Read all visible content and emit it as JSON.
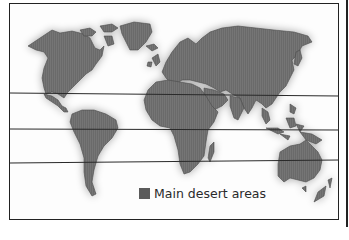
{
  "map": {
    "title": "",
    "land_color": "#6b6b6b",
    "land_outline_color": "#4a4a4a",
    "line_color": "#2a2a2a",
    "frame_color": "#222222",
    "latitude_lines": [
      {
        "name": "tropic-of-cancer",
        "y_left": 93,
        "y_right": 96
      },
      {
        "name": "equator",
        "y_left": 129,
        "y_right": 130
      },
      {
        "name": "tropic-of-capricorn",
        "y_left": 163,
        "y_right": 160
      }
    ],
    "regions": [
      "North America",
      "Greenland",
      "South America",
      "Europe",
      "Asia",
      "Africa",
      "Madagascar",
      "Arabian Peninsula",
      "Indonesia",
      "Australia",
      "New Zealand",
      "Japan",
      "Iceland",
      "British Isles"
    ]
  },
  "legend": {
    "swatch_color": "#5b5b5b",
    "label": "Main desert areas"
  }
}
